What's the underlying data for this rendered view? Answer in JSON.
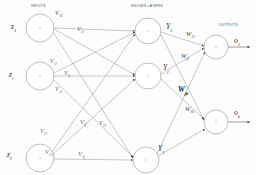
{
  "diagram": {
    "background": "#fdfdfd",
    "stroke": "#888888",
    "node_stroke": "#9a9a9a",
    "text_color": "#2b2b2b"
  },
  "section_labels": {
    "inputs": "INPUTS",
    "hidden": "HIDDEN LAYERS",
    "outputs": "OUTPUTS"
  },
  "layers": {
    "input_nodes": [
      {
        "label": "z",
        "sub": "1",
        "cx": 40,
        "cy": 28,
        "r": 14
      },
      {
        "label": "z",
        "sub": "i",
        "cx": 40,
        "cy": 76,
        "r": 14
      },
      {
        "label": "z",
        "sub": "I",
        "cx": 40,
        "cy": 158,
        "r": 14
      }
    ],
    "hidden_nodes": [
      {
        "label": "Y",
        "sub": "1",
        "cx": 148,
        "cy": 31,
        "r": 13
      },
      {
        "label": "Y",
        "sub": "j",
        "cx": 148,
        "cy": 76,
        "r": 13
      },
      {
        "label": "Y",
        "sub": "J",
        "cx": 146,
        "cy": 160,
        "r": 13
      }
    ],
    "output_nodes": [
      {
        "label": "o",
        "sub": "1",
        "cx": 216,
        "cy": 47,
        "r": 12
      },
      {
        "label": "o",
        "sub": "k",
        "cx": 216,
        "cy": 122,
        "r": 12
      }
    ]
  },
  "input_weight_labels": [
    {
      "base": "V",
      "sub": "11",
      "x": 55,
      "y": 9
    },
    {
      "base": "V",
      "sub": "i1",
      "x": 77,
      "y": 25
    },
    {
      "base": "V",
      "sub": "i1",
      "x": 50,
      "y": 57
    },
    {
      "base": "V",
      "sub": "ij",
      "x": 64,
      "y": 69
    },
    {
      "base": "V",
      "sub": "iJ",
      "x": 55,
      "y": 85
    },
    {
      "base": "V",
      "sub": "I1",
      "x": 40,
      "y": 127
    },
    {
      "base": "V",
      "sub": "Ij",
      "x": 80,
      "y": 118
    },
    {
      "base": "V",
      "sub": "IJ",
      "x": 99,
      "y": 119
    },
    {
      "base": "V",
      "sub": "1J",
      "x": 45,
      "y": 148
    },
    {
      "base": "V",
      "sub": "1j",
      "x": 78,
      "y": 150
    }
  ],
  "output_weight_labels": [
    {
      "base": "W",
      "sub": "11",
      "x": 186,
      "y": 30,
      "bold": false
    },
    {
      "base": "W",
      "sub": "j1",
      "x": 181,
      "y": 52,
      "bold": false
    },
    {
      "base": "W",
      "sub": "jk",
      "x": 178,
      "y": 86,
      "bold": true
    },
    {
      "base": "W",
      "sub": "Jk",
      "x": 185,
      "y": 105,
      "bold": false
    }
  ],
  "connections": {
    "input_to_hidden_count": 9,
    "hidden_to_output_count": 6,
    "output_arrow_count": 2
  }
}
